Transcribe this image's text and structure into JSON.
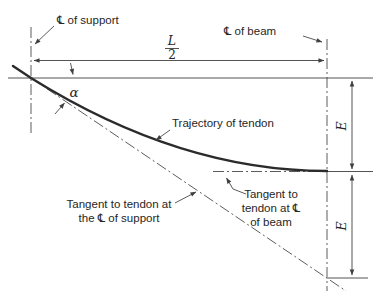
{
  "figure": {
    "labels": {
      "cl_support": "℄ of support",
      "cl_beam": "℄ of beam",
      "span_numerator": "L",
      "span_denominator": "2",
      "angle": "α",
      "trajectory": "Trajectory of tendon",
      "tangent_support_line1": "Tangent to tendon at",
      "tangent_support_line2": "the ℄ of support",
      "tangent_beam_line1": "Tangent to",
      "tangent_beam_line2": "tendon at ℄",
      "tangent_beam_line3": "of beam",
      "eccentricity_upper": "E",
      "eccentricity_lower": "E"
    },
    "colors": {
      "background": "#ffffff",
      "line": "#3f3f3f",
      "tendon": "#2b2b2b",
      "text": "#262626"
    }
  }
}
